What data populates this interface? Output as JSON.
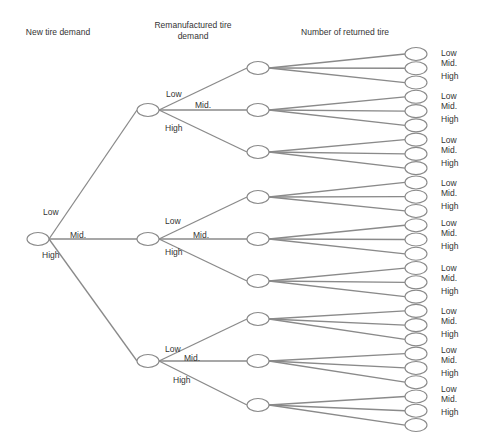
{
  "headers": {
    "level1": "New tire demand",
    "level2": "Remanufactured tire demand",
    "level3": "Number of returned tire"
  },
  "branch_labels": [
    "Low",
    "Mid.",
    "High"
  ],
  "style": {
    "line_color": "#8a8a8a",
    "node_stroke": "#8a8a8a",
    "node_fill": "#ffffff",
    "text_color": "#333333"
  },
  "tree": {
    "root": {
      "x": 38,
      "y": 239
    },
    "level1_nodes": [
      {
        "x": 148,
        "y": 110,
        "branch": "Low"
      },
      {
        "x": 148,
        "y": 239,
        "branch": "Mid."
      },
      {
        "x": 148,
        "y": 361,
        "branch": "High"
      }
    ],
    "level2_x": 258,
    "level2_y": [
      [
        68,
        110,
        152
      ],
      [
        197,
        239,
        281
      ],
      [
        319,
        361,
        405
      ]
    ],
    "leaf_x": 416,
    "leaf_y_start": 54,
    "leaf_y_step": 14.27,
    "leaf_count": 27
  },
  "edge_labels": {
    "root": [
      {
        "text": "Low",
        "x": 43,
        "y": 207
      },
      {
        "text": "Mid.",
        "x": 70,
        "y": 230
      },
      {
        "text": "High",
        "x": 42,
        "y": 250
      }
    ],
    "level1": [
      [
        {
          "text": "Low",
          "x": 166,
          "y": 89
        },
        {
          "text": "Mid.",
          "x": 195,
          "y": 100
        },
        {
          "text": "High",
          "x": 165,
          "y": 123
        }
      ],
      [
        {
          "text": "Low",
          "x": 165,
          "y": 216
        },
        {
          "text": "Mid.",
          "x": 193,
          "y": 230
        },
        {
          "text": "High",
          "x": 165,
          "y": 247
        }
      ],
      [
        {
          "text": "Low",
          "x": 165,
          "y": 344
        },
        {
          "text": "Mid.",
          "x": 184,
          "y": 353
        },
        {
          "text": "High",
          "x": 173,
          "y": 375
        }
      ]
    ]
  },
  "leaf_label_groups": [
    {
      "y": 48,
      "labels": [
        "Low",
        "Mid.",
        "High"
      ]
    },
    {
      "y": 91,
      "labels": [
        "Low",
        "Mid.",
        "High"
      ]
    },
    {
      "y": 135,
      "labels": [
        "Low",
        "Mid.",
        "High"
      ]
    },
    {
      "y": 178,
      "labels": [
        "Low",
        "Mid.",
        "High"
      ]
    },
    {
      "y": 218,
      "labels": [
        "Low",
        "Mid.",
        "High"
      ]
    },
    {
      "y": 263,
      "labels": [
        "Low",
        "Mid.",
        "High"
      ]
    },
    {
      "y": 306,
      "labels": [
        "Low",
        "Mid.",
        "High"
      ]
    },
    {
      "y": 345,
      "labels": [
        "Low",
        "Mid.",
        "High"
      ]
    },
    {
      "y": 384,
      "labels": [
        "Low",
        "Mid.",
        "High"
      ]
    }
  ]
}
